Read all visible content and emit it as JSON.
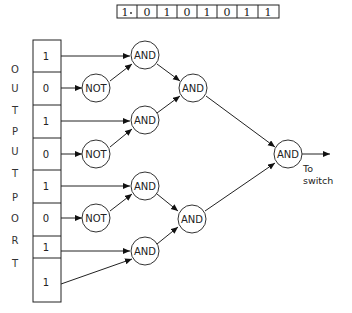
{
  "top_register": {
    "bits": [
      "1",
      "0",
      "1",
      "0",
      "1",
      "0",
      "1",
      "1"
    ],
    "separator_after_index": 0
  },
  "side_label": [
    "O",
    "U",
    "T",
    "P",
    "U",
    "T",
    "P",
    "O",
    "R",
    "T"
  ],
  "output_port": {
    "bits": [
      "1",
      "0",
      "1",
      "0",
      "1",
      "0",
      "1",
      "1"
    ]
  },
  "gates": {
    "not_label": "NOT",
    "and_label": "AND"
  },
  "output_note": {
    "line1": "To",
    "line2": "switch"
  }
}
